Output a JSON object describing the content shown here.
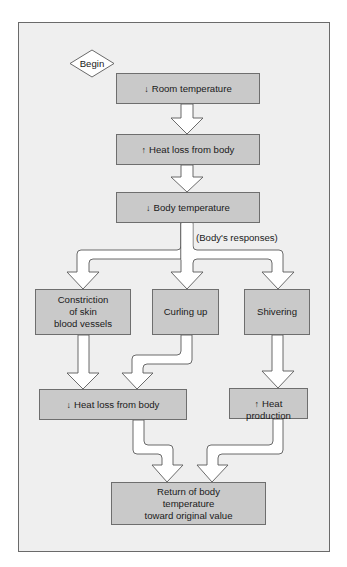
{
  "diagram": {
    "colors": {
      "background": "#efefef",
      "box_fill": "#c9c9c9",
      "box_border": "#6e6e6e",
      "arrow_fill": "#ffffff",
      "arrow_stroke": "#5a5a5a"
    },
    "start": {
      "label": "Begin",
      "shape": "diamond"
    },
    "nodes": [
      {
        "id": "room_temp",
        "indicator": "↓",
        "indicator_meaning": "decrease",
        "label": "Room temperature"
      },
      {
        "id": "heat_loss_up",
        "indicator": "↑",
        "indicator_meaning": "increase",
        "label": "Heat loss from body"
      },
      {
        "id": "body_temp",
        "indicator": "↓",
        "indicator_meaning": "decrease",
        "label": "Body temperature"
      },
      {
        "id": "constriction",
        "indicator": "",
        "label": "Constriction\nof skin\nblood vessels"
      },
      {
        "id": "curling",
        "indicator": "",
        "label": "Curling up"
      },
      {
        "id": "shivering",
        "indicator": "",
        "label": "Shivering"
      },
      {
        "id": "heat_loss_down",
        "indicator": "↓",
        "indicator_meaning": "decrease",
        "label": "Heat loss from body"
      },
      {
        "id": "heat_production",
        "indicator": "↑",
        "indicator_meaning": "increase",
        "label": "Heat\nproduction"
      },
      {
        "id": "return",
        "indicator": "",
        "label": "Return of body\ntemperature\ntoward original value"
      }
    ],
    "branch_label": "(Body's responses)",
    "edges": [
      {
        "from": "begin",
        "to": "room_temp"
      },
      {
        "from": "room_temp",
        "to": "heat_loss_up"
      },
      {
        "from": "heat_loss_up",
        "to": "body_temp"
      },
      {
        "from": "body_temp",
        "to": "constriction",
        "label": "(Body's responses)"
      },
      {
        "from": "body_temp",
        "to": "curling",
        "label": "(Body's responses)"
      },
      {
        "from": "body_temp",
        "to": "shivering",
        "label": "(Body's responses)"
      },
      {
        "from": "constriction",
        "to": "heat_loss_down"
      },
      {
        "from": "curling",
        "to": "heat_loss_down"
      },
      {
        "from": "shivering",
        "to": "heat_production"
      },
      {
        "from": "heat_loss_down",
        "to": "return"
      },
      {
        "from": "heat_production",
        "to": "return"
      }
    ]
  }
}
